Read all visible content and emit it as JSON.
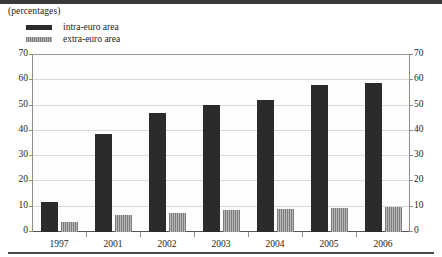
{
  "figure": {
    "subtitle": "(percentages)",
    "legend": [
      {
        "label": "intra-euro area",
        "key": "intra",
        "color": "#2b2b2b"
      },
      {
        "label": "extra-euro area",
        "key": "extra",
        "color": "#a0a0a0"
      }
    ]
  },
  "axis": {
    "yticks": [
      "0",
      "10",
      "20",
      "30",
      "40",
      "50",
      "60",
      "70"
    ]
  },
  "chart_data": {
    "type": "bar",
    "title": "",
    "subtitle": "(percentages)",
    "xlabel": "",
    "ylabel": "",
    "ylim": [
      0,
      70
    ],
    "ytick_step": 10,
    "grid": true,
    "legend_position": "top-left",
    "dual_y_axis": true,
    "categories": [
      "1997",
      "2001",
      "2002",
      "2003",
      "2004",
      "2005",
      "2006"
    ],
    "series": [
      {
        "name": "intra-euro area",
        "color": "#2b2b2b",
        "values": [
          12,
          38.5,
          47,
          50,
          52,
          58,
          58.5
        ]
      },
      {
        "name": "extra-euro area",
        "color": "#a0a0a0",
        "values": [
          4,
          6.5,
          7.5,
          8.5,
          9,
          9.5,
          10
        ]
      }
    ]
  }
}
